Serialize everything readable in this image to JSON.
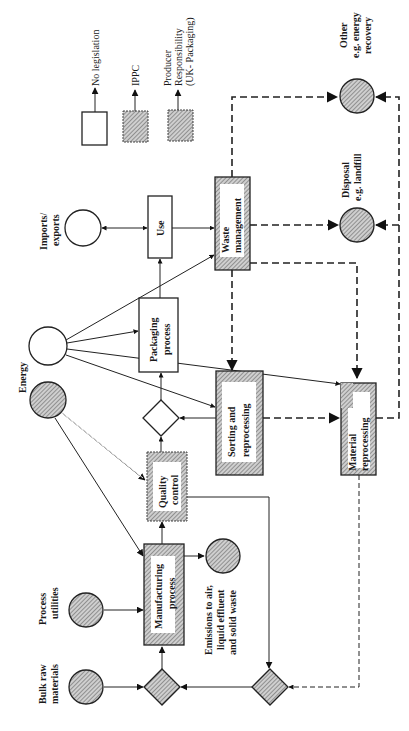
{
  "legend": {
    "items": [
      {
        "key": "none",
        "label": "No legislation",
        "fill": "white"
      },
      {
        "key": "ippc",
        "label": "IPPC",
        "fill": "hatch"
      },
      {
        "key": "producer",
        "label_lines": [
          "Producer",
          "Responsibility",
          "(UK- Packaging)"
        ],
        "fill": "hatch"
      }
    ]
  },
  "nodes": {
    "bulk_raw": {
      "lines": [
        "Bulk raw",
        "materials"
      ],
      "type": "circle",
      "fill": "hatch"
    },
    "process_utilities": {
      "lines": [
        "Process",
        "utilities"
      ],
      "type": "circle",
      "fill": "hatch"
    },
    "manufacturing": {
      "lines": [
        "Manufacturing",
        "process"
      ],
      "type": "box",
      "fill": "hatch"
    },
    "emissions": {
      "lines": [
        "Emissions to air,",
        "liquid effluent",
        "and solid waste"
      ],
      "type": "circle",
      "fill": "hatch"
    },
    "quality_control": {
      "lines": [
        "Quality",
        "control"
      ],
      "type": "box",
      "fill": "hatch"
    },
    "energy": {
      "label": "Energy",
      "type": "circle",
      "fill": "white"
    },
    "energy_ippc": {
      "type": "circle",
      "fill": "hatch"
    },
    "packaging": {
      "lines": [
        "Packaging",
        "process"
      ],
      "type": "box",
      "fill": "white"
    },
    "use": {
      "label": "Use",
      "type": "box",
      "fill": "white"
    },
    "imports": {
      "lines": [
        "Imports/",
        "exports"
      ],
      "type": "circle",
      "fill": "white"
    },
    "waste_mgmt": {
      "lines": [
        "Waste",
        "management"
      ],
      "type": "box",
      "fill": "hatch"
    },
    "sorting": {
      "lines": [
        "Sorting and",
        "reprocessing"
      ],
      "type": "box",
      "fill": "hatch"
    },
    "material_reproc": {
      "lines": [
        "Material",
        "reprocessing"
      ],
      "type": "box",
      "fill": "hatch"
    },
    "disposal": {
      "lines": [
        "Disposal",
        "e.g. landfill"
      ],
      "type": "circle",
      "fill": "hatch"
    },
    "other": {
      "lines": [
        "Other",
        "e.g. energy",
        "recovery"
      ],
      "type": "circle",
      "fill": "hatch"
    }
  },
  "colors": {
    "line": "#222222",
    "hatch": "#888888",
    "background": "#ffffff"
  }
}
